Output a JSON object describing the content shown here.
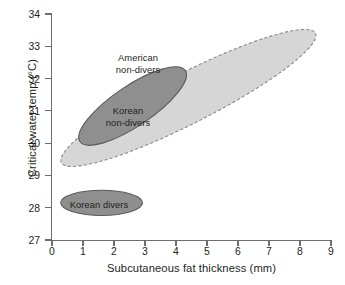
{
  "chart_data": {
    "type": "scatter",
    "title": "",
    "xlabel": "Subcutaneous fat thickness (mm)",
    "ylabel": "Critical water temp (°C)",
    "xlim": [
      0,
      9
    ],
    "ylim": [
      27,
      34
    ],
    "xticks": [
      "0",
      "1",
      "2",
      "3",
      "4",
      "5",
      "6",
      "7",
      "8",
      "9"
    ],
    "yticks": [
      "27",
      "28",
      "29",
      "30",
      "31",
      "32",
      "33",
      "34"
    ],
    "grid": false,
    "legend_position": "inline-labels",
    "groups": [
      {
        "name": "american-non-divers",
        "label_line1": "American",
        "label_line2": "non-divers",
        "fill": "#d6d6d6",
        "stroke": "#8a8a8a",
        "stroke_style": "dashed",
        "center_x": 4.4,
        "center_y": 31.4,
        "semi_major_mm": 4.6,
        "semi_minor_c": 0.78,
        "angle_deg": -27,
        "x_range": [
          0.45,
          8.65
        ],
        "y_range": [
          28.8,
          34.05
        ]
      },
      {
        "name": "korean-non-divers",
        "label_line1": "Korean",
        "label_line2": "non-divers",
        "fill": "#8f8f8f",
        "stroke": "#58595b",
        "stroke_style": "solid",
        "center_x": 2.6,
        "center_y": 31.15,
        "semi_major_mm": 2.05,
        "semi_minor_c": 0.62,
        "angle_deg": -34,
        "x_range": [
          0.6,
          4.35
        ],
        "y_range": [
          29.95,
          32.35
        ]
      },
      {
        "name": "korean-divers",
        "label_line1": "Korean divers",
        "label_line2": "",
        "fill": "#8f8f8f",
        "stroke": "#58595b",
        "stroke_style": "solid",
        "center_x": 1.6,
        "center_y": 28.15,
        "semi_major_mm": 1.32,
        "semi_minor_c": 0.39,
        "angle_deg": 0,
        "x_range": [
          0.28,
          2.92
        ],
        "y_range": [
          27.76,
          28.54
        ]
      }
    ]
  },
  "axes": {
    "x_title": "Subcutaneous fat thickness (mm)",
    "y_title": "Critical water temp (°C)",
    "x_tick_labels": [
      "0",
      "1",
      "2",
      "3",
      "4",
      "5",
      "6",
      "7",
      "8",
      "9"
    ],
    "y_tick_labels": [
      "27",
      "28",
      "29",
      "30",
      "31",
      "32",
      "33",
      "34"
    ]
  },
  "annotations": {
    "american": "American\nnon-divers",
    "korean_non_divers": "Korean\nnon-divers",
    "korean_divers": "Korean divers"
  },
  "colors": {
    "light_fill": "#d6d6d6",
    "light_stroke": "#8a8a8a",
    "dark_fill": "#8f8f8f",
    "dark_stroke": "#58595b",
    "axis": "#6d6e71",
    "text": "#231f20",
    "background": "#ffffff"
  }
}
